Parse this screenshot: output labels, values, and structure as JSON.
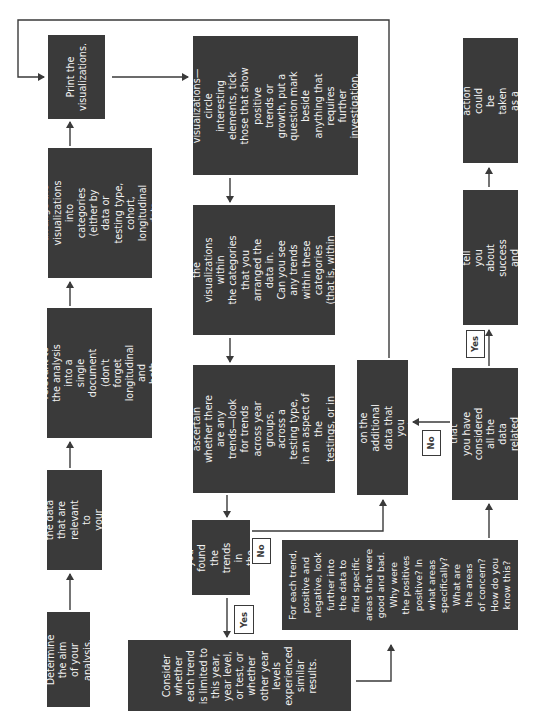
{
  "diagram": {
    "boxes": {
      "print": "Print the\nvisualizations.",
      "arrange": "In this document,\narrange the\nvisualizations into\ncategories (either by\ndata or testing type,\ncohort, longitudinal data\nversus single year).",
      "copy": "Copy the visualizations\nthat are relevant to\nthe analysis into a\nsingle document (don't\nforget longitudinal and\nboth progress and\nachievement data).",
      "choose": "Choose the data\nthat are relevant to\nyour analysis.",
      "determine": "Determine the aim\nof your analysis.",
      "consider_info": "Consider the information\nin each of the\nvisualizations—circle\ninteresting elements, tick\nthose that show positive\ntrends or growth, put a\nquestion mark beside\nanything that requires\nfurther investigation,\ncross anything that\nseems negative.",
      "analyze": "Analyze the annotations\nthat you have made and\nthe visualizations within\nthe categories that you\narranged the data in.\nCan you see any trends\nwithin these categories\n(that is, within year\ngroups, testing types,\nand so on)?",
      "next_look": "Next, look across\ncategories to ascertain\nwhether there are any\ntrends—look for trends\nacross year groups,\nacross a testing type,\nin an aspect of the\ntestings, or in progress\nor achievement.",
      "found_trends": "Have you\nfound the\ntrends in\nthe data?",
      "consider_whether": "Consider\nwhether\neach trend\nis limited to\nthis year,\nyear level,\nor test, or\nwhether\nother year\nlevels\nexperienced\nsimilar\nresults.",
      "decide": "Decide on the additional\ndata that you require.",
      "for_each_trend": "For each trend,\npositive and\nnegative, look\nfurther into\nthe data to\nfind specific\nareas that were\ngood and bad.\nWhy were\nthe positives\npositive? In\nwhat areas\nspecifically?\nWhat are\nthe areas\nof concern?\nHow do you\nknow this?",
      "satisfied": "Are you satisfied that\nyou have considered\nall the data related\nto this topic?",
      "what_trends": "What do the trends tell\nyou about success and\nareas requiring change?",
      "what_steps": "What steps for action\ncould be taken as a\nresult of the data?"
    },
    "labels": {
      "yes_found": "Yes",
      "no_found": "No",
      "no_satisfied": "No",
      "yes_satisfied": "Yes"
    },
    "colors": {
      "box_fill": "#3a3a3a",
      "box_text": "#f2f2f2",
      "line": "#3a3a3a"
    }
  }
}
